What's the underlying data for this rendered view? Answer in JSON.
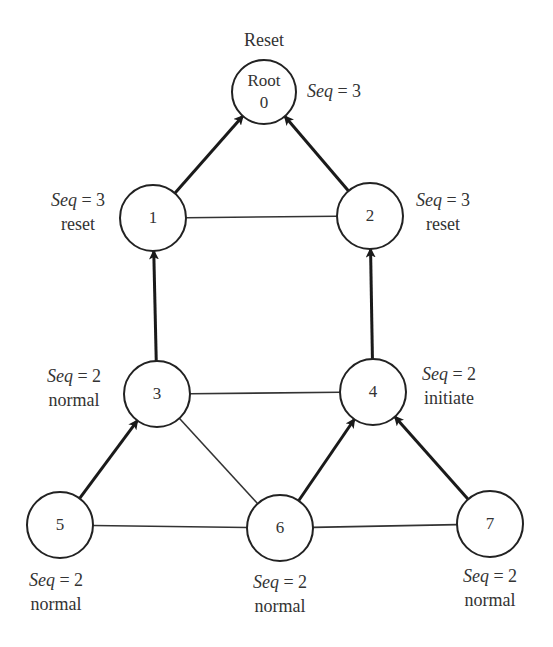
{
  "diagram": {
    "title": "",
    "root_top_label": "Reset",
    "nodes": [
      {
        "id": "root",
        "label_line1": "Root",
        "label_line2": "0",
        "cx": 264,
        "cy": 92,
        "r": 32,
        "annot_seq_var": "Seq",
        "annot_seq_eq": " = 3",
        "annot_state": "",
        "annot_x": 334,
        "annot_y": 97
      },
      {
        "id": "1",
        "label_line1": "1",
        "cx": 153,
        "cy": 218,
        "r": 33,
        "annot_seq_var": "Seq",
        "annot_seq_eq": " = 3",
        "annot_state": "reset",
        "annot_x": 78,
        "annot_y": 216
      },
      {
        "id": "2",
        "label_line1": "2",
        "cx": 370,
        "cy": 216,
        "r": 33,
        "annot_seq_var": "Seq",
        "annot_seq_eq": " = 3",
        "annot_state": "reset",
        "annot_x": 443,
        "annot_y": 216
      },
      {
        "id": "3",
        "label_line1": "3",
        "cx": 157,
        "cy": 394,
        "r": 33,
        "annot_seq_var": "Seq",
        "annot_seq_eq": " = 2",
        "annot_state": "normal",
        "annot_x": 74,
        "annot_y": 392
      },
      {
        "id": "4",
        "label_line1": "4",
        "cx": 373,
        "cy": 392,
        "r": 33,
        "annot_seq_var": "Seq",
        "annot_seq_eq": " = 2",
        "annot_state": "initiate",
        "annot_x": 449,
        "annot_y": 390
      },
      {
        "id": "5",
        "label_line1": "5",
        "cx": 60,
        "cy": 525,
        "r": 33,
        "annot_seq_var": "Seq",
        "annot_seq_eq": " = 2",
        "annot_state": "normal",
        "annot_x": 56,
        "annot_y": 596
      },
      {
        "id": "6",
        "label_line1": "6",
        "cx": 280,
        "cy": 528,
        "r": 33,
        "annot_seq_var": "Seq",
        "annot_seq_eq": " = 2",
        "annot_state": "normal",
        "annot_x": 280,
        "annot_y": 598
      },
      {
        "id": "7",
        "label_line1": "7",
        "cx": 490,
        "cy": 524,
        "r": 33,
        "annot_seq_var": "Seq",
        "annot_seq_eq": " = 2",
        "annot_state": "normal",
        "annot_x": 490,
        "annot_y": 592
      }
    ],
    "directed_edges": [
      {
        "from": "1",
        "to": "root"
      },
      {
        "from": "2",
        "to": "root"
      },
      {
        "from": "3",
        "to": "1"
      },
      {
        "from": "4",
        "to": "2"
      },
      {
        "from": "5",
        "to": "3"
      },
      {
        "from": "6",
        "to": "4"
      },
      {
        "from": "7",
        "to": "4"
      }
    ],
    "undirected_edges": [
      {
        "from": "1",
        "to": "2"
      },
      {
        "from": "3",
        "to": "4"
      },
      {
        "from": "3",
        "to": "6"
      },
      {
        "from": "5",
        "to": "6"
      },
      {
        "from": "6",
        "to": "7"
      }
    ],
    "colors": {
      "stroke": "#222222",
      "text": "#333333",
      "background": "#ffffff"
    }
  }
}
